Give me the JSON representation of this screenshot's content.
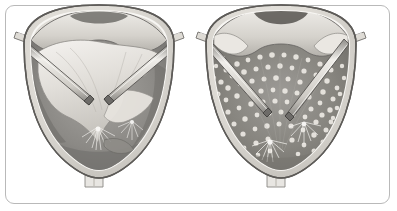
{
  "figure": {
    "title": "Cystoscopic comparison of bladder mucosa",
    "type": "medical-illustration",
    "border_color": "#b9b9b9",
    "background_color": "#ffffff",
    "panel_count": 2
  },
  "palette": {
    "outline": "#4a4a4a",
    "wall_light": "#e4e2de",
    "wall_mid": "#cdcac4",
    "wall_shadow": "#a9a6a0",
    "lumen_dark": "#7e7c79",
    "lumen_mid": "#96948f",
    "mucosa_light": "#d8d5cf",
    "mucosa_highlight": "#f1efeb",
    "instrument_body": "#d9d7d2",
    "instrument_edge": "#5c5a57",
    "speckle": "#ece9e3",
    "port_fill": "#dedbd5"
  },
  "panels": [
    {
      "id": "panel-left",
      "name": "pre-treatment-view",
      "label": "Left panel",
      "description": "Bladder interior, smooth mucosa with prominent mucosal fold and two rod instruments converging toward the base",
      "mucosa_state": "smooth",
      "speckled": false,
      "instrument_count": 2,
      "port_count": 2,
      "stem_label": "urethral-stem",
      "lesion_points": 2
    },
    {
      "id": "panel-right",
      "name": "post-treatment-view",
      "label": "Right panel",
      "description": "Bladder interior showing diffuse speckled granular mucosa with two rod instruments converging toward the base",
      "mucosa_state": "speckled",
      "speckled": true,
      "speckle_count": 210,
      "instrument_count": 2,
      "port_count": 2,
      "stem_label": "urethral-stem",
      "lesion_points": 2
    }
  ],
  "annotation": {
    "signature": "",
    "signature_visible": true
  }
}
